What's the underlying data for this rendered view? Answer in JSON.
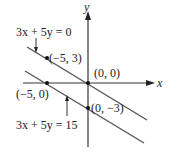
{
  "diagram": {
    "axes": {
      "x_label": "x",
      "y_label": "y"
    },
    "lines": [
      {
        "equation": "3x + 5y = 0"
      },
      {
        "equation": "3x + 5y = 15"
      }
    ],
    "points": [
      {
        "label": "(−5, 3)"
      },
      {
        "label": "(0, 0)"
      },
      {
        "label": "(−5, 0)"
      },
      {
        "label": "(0, −3)"
      }
    ],
    "colors": {
      "ink": "#222222",
      "line": "#555555"
    }
  }
}
